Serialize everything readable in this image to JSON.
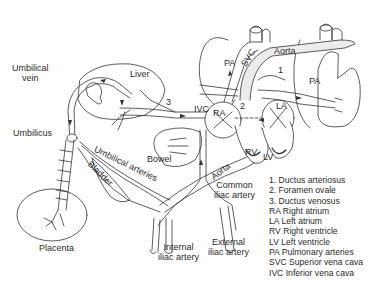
{
  "diagram": {
    "labels": {
      "umbilical_vein": [
        "Umbilical",
        "vein"
      ],
      "liver": "Liver",
      "umbilicus": "Umbilicus",
      "ductus_number": "3",
      "ivc": "IVC",
      "ra": "RA",
      "la": "LA",
      "foramen_number": "2",
      "ductus_arteriosus_number": "1",
      "svc": "SVC",
      "aorta_upper": "Aorta",
      "pa_left": "PA",
      "pa_right": "PA",
      "rv": "RV",
      "lv": "LV",
      "bowel": "Bowel",
      "umbilical_arteries": "Umbilical arteries",
      "bladder": "Bladder",
      "aorta_lower": "Aorta",
      "common_iliac": [
        "Common",
        "iliac artery"
      ],
      "internal_iliac": [
        "Internal",
        "iliac artery"
      ],
      "external_iliac": [
        "External",
        "iliac artery"
      ],
      "placenta": "Placenta"
    },
    "legend": [
      "1. Ductus arteriosus",
      "2. Foramen ovale",
      "3. Ductus venosus",
      "RA Right atrium",
      "LA Left atrium",
      "RV Right ventricle",
      "LV Left ventricle",
      "PA Pulmonary arteries",
      "SVC Superior vena cava",
      "IVC Inferior vena cava"
    ],
    "colors": {
      "line": "#333333",
      "vessel_fill": "#e8e8e8",
      "background": "#ffffff"
    }
  }
}
